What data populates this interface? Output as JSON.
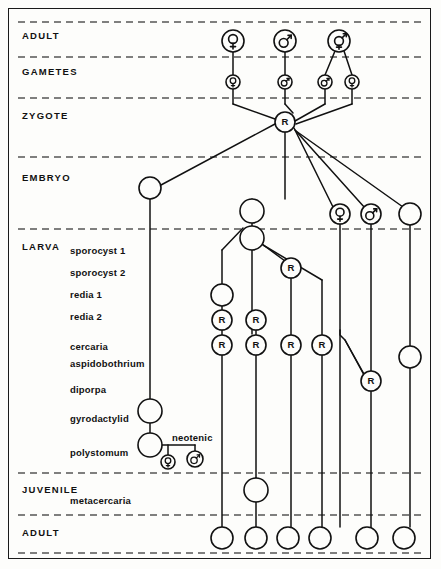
{
  "figure": {
    "kind": "life-cycle-diagram",
    "width": 441,
    "height": 569,
    "line_color": "#111111",
    "dash_color": "#555555",
    "background": "#fdfdfb",
    "frame_color": "#1a1a1a"
  },
  "stages": [
    {
      "id": "adult-top",
      "label": "ADULT",
      "x": 22,
      "y": 30
    },
    {
      "id": "gametes",
      "label": "GAMETES",
      "x": 22,
      "y": 66
    },
    {
      "id": "zygote",
      "label": "ZYGOTE",
      "x": 22,
      "y": 110
    },
    {
      "id": "embryo",
      "label": "EMBRYO",
      "x": 22,
      "y": 172
    },
    {
      "id": "larva",
      "label": "LARVA",
      "x": 22,
      "y": 241
    },
    {
      "id": "juvenile",
      "label": "JUVENILE",
      "x": 22,
      "y": 484
    },
    {
      "id": "adult-bottom",
      "label": "ADULT",
      "x": 22,
      "y": 527
    }
  ],
  "divider_lines": [
    {
      "id": "div-adult-top",
      "y": 22
    },
    {
      "id": "div-gametes",
      "y": 57
    },
    {
      "id": "div-zygote",
      "y": 98
    },
    {
      "id": "div-embryo",
      "y": 157
    },
    {
      "id": "div-larva",
      "y": 229
    },
    {
      "id": "div-juvenile",
      "y": 473
    },
    {
      "id": "div-adult-bot",
      "y": 515
    },
    {
      "id": "div-bottom",
      "y": 553
    }
  ],
  "larva_types": [
    {
      "id": "sporocyst-1",
      "label": "sporocyst 1",
      "x": 70,
      "y": 245
    },
    {
      "id": "sporocyst-2",
      "label": "sporocyst 2",
      "x": 70,
      "y": 267
    },
    {
      "id": "redia-1",
      "label": "redia 1",
      "x": 70,
      "y": 289
    },
    {
      "id": "redia-2",
      "label": "redia 2",
      "x": 70,
      "y": 311
    },
    {
      "id": "cercaria",
      "label": "cercaria",
      "x": 70,
      "y": 341
    },
    {
      "id": "aspidobothrium",
      "label": "aspidobothrium",
      "x": 70,
      "y": 358
    },
    {
      "id": "diporpa",
      "label": "diporpa",
      "x": 70,
      "y": 384
    },
    {
      "id": "gyrodactylid",
      "label": "gyrodactylid",
      "x": 70,
      "y": 413
    },
    {
      "id": "polystomum",
      "label": "polystomum",
      "x": 70,
      "y": 447
    },
    {
      "id": "metacercaria",
      "label": "metacercaria",
      "x": 70,
      "y": 495
    }
  ],
  "annotations": [
    {
      "id": "neotenic",
      "label": "neotenic",
      "x": 172,
      "y": 432
    }
  ],
  "node_glyphs": {
    "female": "♀",
    "male": "♂",
    "hermaphrodite": "⚥",
    "regeneration": "R"
  },
  "nodes": {
    "adult_top": [
      {
        "id": "adult-top-female",
        "x": 233,
        "y": 41,
        "r": 11,
        "glyph": "female"
      },
      {
        "id": "adult-top-male",
        "x": 285,
        "y": 41,
        "r": 11,
        "glyph": "male"
      },
      {
        "id": "adult-top-hermaphrodite",
        "x": 339,
        "y": 41,
        "r": 11,
        "glyph": "hermaphrodite"
      }
    ],
    "gametes": [
      {
        "id": "gamete-ovum-1",
        "x": 233,
        "y": 82,
        "r": 7,
        "glyph": "female"
      },
      {
        "id": "gamete-sperm-1",
        "x": 285,
        "y": 82,
        "r": 7,
        "glyph": "male"
      },
      {
        "id": "gamete-sperm-2",
        "x": 325,
        "y": 82,
        "r": 7,
        "glyph": "male"
      },
      {
        "id": "gamete-ovum-2",
        "x": 352,
        "y": 82,
        "r": 7,
        "glyph": "female"
      }
    ],
    "zygote": [
      {
        "id": "zygote-node",
        "x": 285,
        "y": 122,
        "r": 10,
        "glyph": "regeneration"
      }
    ],
    "embryo": [
      {
        "id": "embryo-left",
        "x": 150,
        "y": 188,
        "r": 11,
        "glyph": null
      },
      {
        "id": "embryo-center",
        "x": 252,
        "y": 211,
        "r": 12,
        "glyph": null
      },
      {
        "id": "embryo-female",
        "x": 340,
        "y": 214,
        "r": 10,
        "glyph": "female"
      },
      {
        "id": "embryo-male",
        "x": 371,
        "y": 214,
        "r": 10,
        "glyph": "male"
      },
      {
        "id": "embryo-right",
        "x": 410,
        "y": 214,
        "r": 11,
        "glyph": null
      }
    ],
    "larva": [
      {
        "id": "sporocyst-node",
        "x": 252,
        "y": 238,
        "r": 12,
        "glyph": null
      },
      {
        "id": "redia-branch-node",
        "x": 291,
        "y": 268,
        "r": 10,
        "glyph": "regeneration"
      },
      {
        "id": "redia1-plain",
        "x": 222,
        "y": 295,
        "r": 11,
        "glyph": null
      },
      {
        "id": "redia2-left",
        "x": 222,
        "y": 320,
        "r": 10,
        "glyph": "regeneration"
      },
      {
        "id": "redia2-mid",
        "x": 256,
        "y": 320,
        "r": 10,
        "glyph": "regeneration"
      },
      {
        "id": "cercaria-1",
        "x": 222,
        "y": 345,
        "r": 10,
        "glyph": "regeneration"
      },
      {
        "id": "cercaria-2",
        "x": 256,
        "y": 345,
        "r": 10,
        "glyph": "regeneration"
      },
      {
        "id": "cercaria-3",
        "x": 291,
        "y": 345,
        "r": 10,
        "glyph": "regeneration"
      },
      {
        "id": "cercaria-4",
        "x": 322,
        "y": 345,
        "r": 10,
        "glyph": "regeneration"
      },
      {
        "id": "aspidobothrium-right",
        "x": 410,
        "y": 357,
        "r": 11,
        "glyph": null
      },
      {
        "id": "diporpa-node",
        "x": 371,
        "y": 381,
        "r": 10,
        "glyph": "regeneration"
      },
      {
        "id": "gyrodactylid-node",
        "x": 150,
        "y": 411,
        "r": 12,
        "glyph": null
      },
      {
        "id": "polystomum-node",
        "x": 150,
        "y": 445,
        "r": 12,
        "glyph": null
      },
      {
        "id": "neotenic-female",
        "x": 168,
        "y": 462,
        "r": 7,
        "glyph": "female"
      },
      {
        "id": "neotenic-male",
        "x": 195,
        "y": 459,
        "r": 8,
        "glyph": "male"
      }
    ],
    "juvenile": [
      {
        "id": "metacercaria-node",
        "x": 256,
        "y": 490,
        "r": 12,
        "glyph": null
      }
    ],
    "adult_bottom": [
      {
        "id": "adult-bot-1",
        "x": 222,
        "y": 538,
        "r": 11,
        "glyph": null
      },
      {
        "id": "adult-bot-2",
        "x": 256,
        "y": 538,
        "r": 11,
        "glyph": null
      },
      {
        "id": "adult-bot-3",
        "x": 288,
        "y": 538,
        "r": 11,
        "glyph": null
      },
      {
        "id": "adult-bot-4",
        "x": 320,
        "y": 538,
        "r": 11,
        "glyph": null
      },
      {
        "id": "adult-bot-5",
        "x": 367,
        "y": 538,
        "r": 11,
        "glyph": null
      },
      {
        "id": "adult-bot-6",
        "x": 404,
        "y": 538,
        "r": 11,
        "glyph": null
      }
    ]
  },
  "edges": [
    {
      "id": "e-adult-f-to-ovum",
      "points": "233,52 233,75"
    },
    {
      "id": "e-adult-m-to-sperm",
      "points": "285,52 285,75"
    },
    {
      "id": "e-herm-to-sperm",
      "points": "335,51 325,75"
    },
    {
      "id": "e-herm-to-ovum",
      "points": "344,51 352,75"
    },
    {
      "id": "e-ovum1-down",
      "points": "233,89 233,104"
    },
    {
      "id": "e-sperm1-down",
      "points": "285,89 285,104"
    },
    {
      "id": "e-sperm2-down",
      "points": "325,89 325,104"
    },
    {
      "id": "e-ovum2-down",
      "points": "352,89 352,104"
    },
    {
      "id": "e-ovum1-to-zyg",
      "points": "233,104 275,119"
    },
    {
      "id": "e-sperm1-to-zyg",
      "points": "285,104 293,113"
    },
    {
      "id": "e-sperm2-to-zyg",
      "points": "325,104 295,121"
    },
    {
      "id": "e-ovum2-to-zyg",
      "points": "352,104 296,124"
    },
    {
      "id": "e-zyg-to-embryo-left",
      "points": "275,124 161,185"
    },
    {
      "id": "e-zyg-down",
      "points": "285,132 285,199"
    },
    {
      "id": "e-zyg-to-embryo-f",
      "points": "294,128 333,207"
    },
    {
      "id": "e-zyg-to-embryo-m",
      "points": "295,130 365,208"
    },
    {
      "id": "e-zyg-to-embryo-r",
      "points": "296,131 403,207"
    },
    {
      "id": "e-embryo-center-down",
      "points": "252,199 252,226"
    },
    {
      "id": "e-embryo-left-down",
      "points": "150,199 150,399"
    },
    {
      "id": "e-embryo-f-down",
      "points": "340,224 340,527"
    },
    {
      "id": "e-embryo-m-down",
      "points": "371,224 371,371"
    },
    {
      "id": "e-embryo-r-down",
      "points": "410,225 410,346"
    },
    {
      "id": "e-sporo-to-branchL",
      "points": "243,228 222,250"
    },
    {
      "id": "e-branchL-down",
      "points": "222,250 222,284"
    },
    {
      "id": "e-sporo-down",
      "points": "252,250 252,334"
    },
    {
      "id": "e-sporo-to-rediaR",
      "points": "262,244 285,261"
    },
    {
      "id": "e-sporo-to-cerc4",
      "points": "263,245 322,280"
    },
    {
      "id": "e-cerc4-down",
      "points": "322,280 322,335"
    },
    {
      "id": "e-rediaR-down",
      "points": "291,278 291,335"
    },
    {
      "id": "e-redia1-down",
      "points": "222,306 222,310"
    },
    {
      "id": "e-redia2L-down",
      "points": "222,330 222,335"
    },
    {
      "id": "e-redia2M-down",
      "points": "256,330 256,335"
    },
    {
      "id": "e-cerc1-down",
      "points": "222,355 222,527"
    },
    {
      "id": "e-cerc2-down",
      "points": "256,355 256,478"
    },
    {
      "id": "e-cerc3-down",
      "points": "291,355 291,527"
    },
    {
      "id": "e-cerc4b-down",
      "points": "322,355 322,527"
    },
    {
      "id": "e-embryo-m-to-dip",
      "points": "371,371 371,371"
    },
    {
      "id": "e-asp-to-dip",
      "points": "345,340 364,375"
    },
    {
      "id": "e-dip-down",
      "points": "371,391 371,527"
    },
    {
      "id": "e-asp-right-down",
      "points": "410,368 410,527"
    },
    {
      "id": "e-gyro-down",
      "points": "150,423 150,433"
    },
    {
      "id": "e-poly-to-neo",
      "points": "162,445 195,445"
    },
    {
      "id": "e-neo-f-stem",
      "points": "168,445 168,455"
    },
    {
      "id": "e-neo-m-stem",
      "points": "195,445 195,451"
    },
    {
      "id": "e-metacerc-in",
      "points": "256,478 256,478"
    },
    {
      "id": "e-metacerc-down",
      "points": "256,502 256,527"
    }
  ],
  "branch_lines": [
    {
      "id": "b-asp-to-diporpa",
      "points": "340,330 340,335 345,340 364,374"
    }
  ]
}
